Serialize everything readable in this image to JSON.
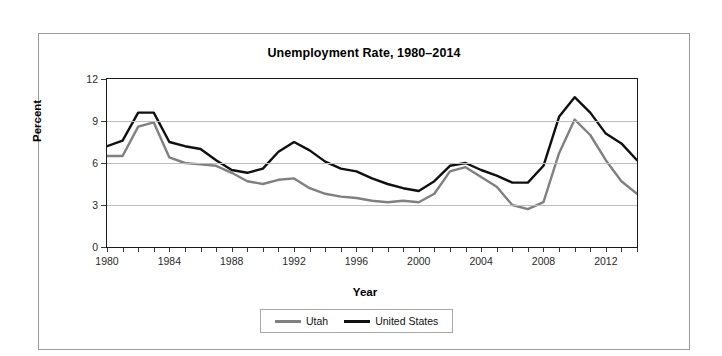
{
  "chart_data": {
    "type": "line",
    "title": "Unemployment Rate, 1980–2014",
    "xlabel": "Year",
    "ylabel": "Percent",
    "xlim": [
      1980,
      2014
    ],
    "ylim": [
      0,
      12
    ],
    "yticks": [
      0,
      3,
      6,
      9,
      12
    ],
    "xticks": [
      1980,
      1984,
      1988,
      1992,
      1996,
      2000,
      2004,
      2008,
      2012
    ],
    "grid": "horizontal",
    "legend_position": "bottom-center",
    "x": [
      1980,
      1981,
      1982,
      1983,
      1984,
      1985,
      1986,
      1987,
      1988,
      1989,
      1990,
      1991,
      1992,
      1993,
      1994,
      1995,
      1996,
      1997,
      1998,
      1999,
      2000,
      2001,
      2002,
      2003,
      2004,
      2005,
      2006,
      2007,
      2008,
      2009,
      2010,
      2011,
      2012,
      2013,
      2014
    ],
    "series": [
      {
        "name": "Utah",
        "color": "#808080",
        "values": [
          6.5,
          6.5,
          8.6,
          8.9,
          6.4,
          6.0,
          5.9,
          5.8,
          5.3,
          4.7,
          4.5,
          4.8,
          4.9,
          4.2,
          3.8,
          3.6,
          3.5,
          3.3,
          3.2,
          3.3,
          3.2,
          3.8,
          5.4,
          5.7,
          5.0,
          4.3,
          3.0,
          2.7,
          3.2,
          6.7,
          9.1,
          8.0,
          6.2,
          4.7,
          3.8
        ]
      },
      {
        "name": "United States",
        "color": "#101010",
        "values": [
          7.2,
          7.6,
          9.6,
          9.6,
          7.5,
          7.2,
          7.0,
          6.2,
          5.5,
          5.3,
          5.6,
          6.8,
          7.5,
          6.9,
          6.1,
          5.6,
          5.4,
          4.9,
          4.5,
          4.2,
          4.0,
          4.7,
          5.8,
          6.0,
          5.5,
          5.1,
          4.6,
          4.6,
          5.8,
          9.3,
          10.7,
          9.6,
          8.1,
          7.4,
          6.2
        ]
      }
    ]
  },
  "legend": {
    "items": [
      {
        "label": "Utah",
        "color": "#808080"
      },
      {
        "label": "United States",
        "color": "#101010"
      }
    ]
  }
}
